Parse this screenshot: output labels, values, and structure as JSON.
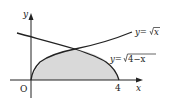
{
  "axes": {
    "x_label": "x",
    "y_label": "y",
    "origin_label": "O",
    "tick_4": "4"
  },
  "curves": [
    {
      "name": "sqrt-x",
      "label": "y=√x",
      "expr_prefix": "y=",
      "radicand": "x"
    },
    {
      "name": "sqrt-4-minus-x",
      "label": "y=√(4−x)",
      "expr_prefix": "y=",
      "radicand": "4−x"
    }
  ],
  "shaded_region": {
    "description": "Region under y=√x and y=√(4−x) from x=0 to x=4",
    "fill": "#d9d9d9"
  },
  "colors": {
    "stroke": "#222222",
    "fill": "#d9d9d9"
  }
}
